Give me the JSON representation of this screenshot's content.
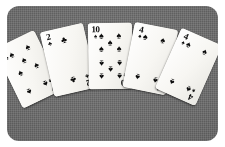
{
  "scene": {
    "description": "Fan of five playing cards on a textured gray surface",
    "background_color": "#6b6b6b",
    "outer_margin_color": "#ffffff",
    "card_face_color": "#f7f6f2",
    "pip_color": "#0b0b0b",
    "corner_radius_px": 12
  },
  "suit_glyphs": {
    "spade": "♠",
    "club": "♣",
    "heart": "♥",
    "diamond": "♦"
  },
  "hand": {
    "card_count": 5,
    "cards": [
      {
        "rank": "7",
        "suit": "spade",
        "suit_glyph": "♠",
        "color": "black",
        "pip_count": 7,
        "rotation_deg": -26,
        "left_px": 14,
        "top_px": 27
      },
      {
        "rank": "2",
        "suit": "club",
        "suit_glyph": "♣",
        "color": "black",
        "pip_count": 2,
        "rotation_deg": -13,
        "left_px": 47,
        "top_px": 20
      },
      {
        "rank": "10",
        "suit": "spade",
        "suit_glyph": "♠",
        "color": "black",
        "pip_count": 10,
        "rotation_deg": -1,
        "left_px": 82,
        "top_px": 17
      },
      {
        "rank": "4",
        "suit": "spade",
        "suit_glyph": "♠",
        "color": "black",
        "pip_count": 4,
        "rotation_deg": 11,
        "left_px": 115,
        "top_px": 19
      },
      {
        "rank": "4",
        "suit": "spade",
        "suit_glyph": "♠",
        "color": "black",
        "pip_count": 4,
        "rotation_deg": 24,
        "left_px": 146,
        "top_px": 25
      }
    ]
  }
}
